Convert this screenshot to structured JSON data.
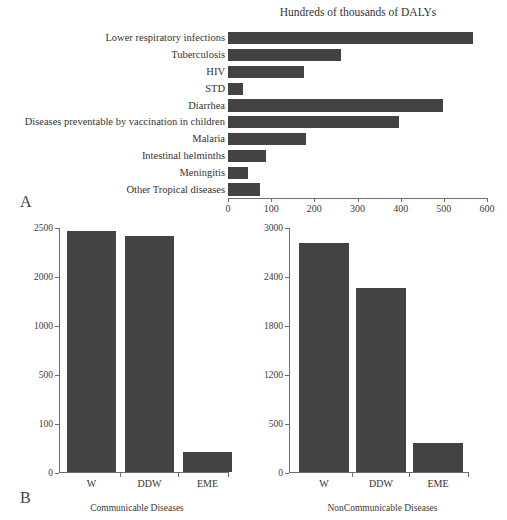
{
  "figure": {
    "panel_a_letter": "A",
    "panel_b_letter": "B"
  },
  "chart_data": [
    {
      "id": "panel_a",
      "type": "bar",
      "orientation": "horizontal",
      "title": "Hundreds of thousands of DALYs",
      "xlabel": "",
      "ylabel": "",
      "xlim": [
        0,
        600
      ],
      "xticks": [
        0,
        100,
        200,
        300,
        400,
        500,
        600
      ],
      "xticklabels": [
        "0",
        "100",
        "200",
        "300",
        "400",
        "500",
        "600"
      ],
      "grid": false,
      "legend": "none",
      "bar_color": "#434343",
      "categories": [
        "Lower respiratory infections",
        "Tuberculosis",
        "HIV",
        "STD",
        "Diarrhea",
        "Diseases preventable by vaccination in children",
        "Malaria",
        "Intestinal helminths",
        "Meningitis",
        "Other Tropical diseases"
      ],
      "values": [
        567,
        262,
        175,
        35,
        498,
        396,
        181,
        89,
        46,
        74
      ]
    },
    {
      "id": "panel_b_left",
      "type": "bar",
      "orientation": "vertical",
      "title": "",
      "xlabel": "Communicable Diseases",
      "ylabel": "",
      "ylim": [
        0,
        2500
      ],
      "yticks": [
        0,
        100,
        500,
        1000,
        2000,
        2500
      ],
      "yticklabels": [
        "0",
        "100",
        "500",
        "1000",
        "2000",
        "2500"
      ],
      "grid": false,
      "legend": "none",
      "bar_color": "#434343",
      "categories": [
        "W",
        "DDW",
        "EME"
      ],
      "values": [
        2455,
        2410,
        40
      ]
    },
    {
      "id": "panel_b_right",
      "type": "bar",
      "orientation": "vertical",
      "title": "",
      "xlabel": "NonCommunicable Diseases",
      "ylabel": "",
      "ylim": [
        0,
        3000
      ],
      "yticks": [
        0,
        500,
        1200,
        1800,
        2400,
        3000
      ],
      "yticklabels": [
        "0",
        "500",
        "1200",
        "1800",
        "2400",
        "3000"
      ],
      "grid": false,
      "legend": "none",
      "bar_color": "#434343",
      "categories": [
        "W",
        "DDW",
        "EME"
      ],
      "values": [
        2800,
        2250,
        290
      ]
    }
  ]
}
